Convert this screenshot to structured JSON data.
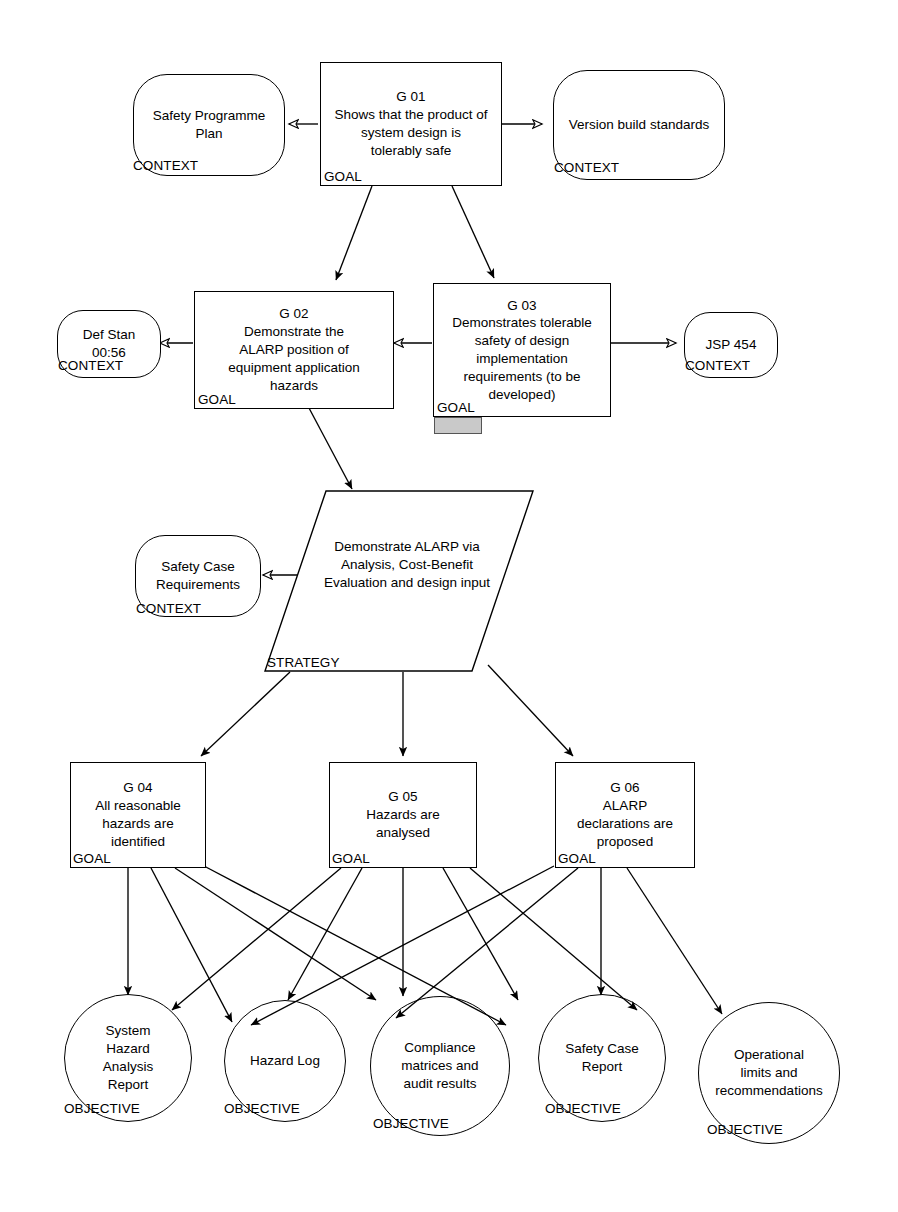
{
  "diagram": {
    "notation": "Goal Structuring Notation",
    "type_labels": {
      "goal": "GOAL",
      "context": "CONTEXT",
      "objective": "OBJECTIVE",
      "strategy": "STRATEGY"
    },
    "colors": {
      "stroke": "#000000",
      "background": "#ffffff",
      "highlight_fill": "#c9c9c9"
    }
  },
  "nodes": {
    "g01": {
      "id": "G 01",
      "text": "G 01\nShows that the product of\nsystem design is\ntolerably safe",
      "kind": "GOAL"
    },
    "g02": {
      "id": "G 02",
      "text": "G 02\nDemonstrate the\nALARP position of\nequipment application\nhazards",
      "kind": "GOAL"
    },
    "g03": {
      "id": "G 03",
      "text": "G 03\nDemonstrates tolerable\nsafety of design\nimplementation\nrequirements (to be\ndeveloped)",
      "kind": "GOAL"
    },
    "g04": {
      "id": "G 04",
      "text": "G 04\nAll reasonable\nhazards are\nidentified",
      "kind": "GOAL"
    },
    "g05": {
      "id": "G 05",
      "text": "G 05\nHazards are\nanalysed",
      "kind": "GOAL"
    },
    "g06": {
      "id": "G 06",
      "text": "G 06\nALARP\ndeclarations are\nproposed",
      "kind": "GOAL"
    },
    "ctx_safety_programme_plan": {
      "text": "Safety Programme\nPlan",
      "kind": "CONTEXT"
    },
    "ctx_version_build_standards": {
      "text": "Version build standards",
      "kind": "CONTEXT"
    },
    "ctx_def_stan": {
      "text": "Def Stan\n00:56",
      "kind": "CONTEXT"
    },
    "ctx_jsp_454": {
      "text": "JSP 454",
      "kind": "CONTEXT"
    },
    "ctx_safety_case_requirements": {
      "text": "Safety Case\nRequirements",
      "kind": "CONTEXT"
    },
    "strategy": {
      "text": "Demonstrate ALARP via\nAnalysis, Cost-Benefit\nEvaluation and design\ninput",
      "kind": "STRATEGY"
    },
    "obj_system_hazard_analysis_report": {
      "text": "System\nHazard\nAnalysis\nReport",
      "kind": "OBJECTIVE"
    },
    "obj_hazard_log": {
      "text": "Hazard Log",
      "kind": "OBJECTIVE"
    },
    "obj_compliance_matrices": {
      "text": "Compliance\nmatrices and\naudit results",
      "kind": "OBJECTIVE"
    },
    "obj_safety_case_report": {
      "text": "Safety Case\nReport",
      "kind": "OBJECTIVE"
    },
    "obj_operational_limits": {
      "text": "Operational\nlimits and\nrecommendations",
      "kind": "OBJECTIVE"
    }
  }
}
